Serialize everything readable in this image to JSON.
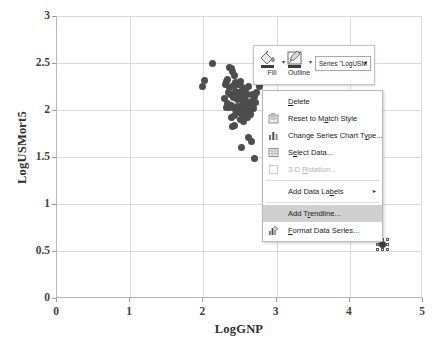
{
  "chart_data": {
    "type": "scatter",
    "title": "",
    "xlabel": "LogGNP",
    "ylabel": "LogUSMort5",
    "xlim": [
      0,
      5
    ],
    "ylim": [
      0,
      3
    ],
    "xticks": [
      "0",
      "1",
      "2",
      "3",
      "4",
      "5"
    ],
    "yticks": [
      "0",
      "0.5",
      "1",
      "1.5",
      "2",
      "2.5",
      "3"
    ],
    "grid": true,
    "legend": "none",
    "series": [
      {
        "name": "LogUSMort5",
        "marker": "circle",
        "color": "#4d4d4d",
        "points": [
          [
            2.13,
            2.49
          ],
          [
            2.01,
            2.31
          ],
          [
            1.99,
            2.25
          ],
          [
            2.31,
            2.3
          ],
          [
            2.33,
            2.32
          ],
          [
            2.3,
            2.27
          ],
          [
            2.35,
            2.45
          ],
          [
            2.38,
            2.44
          ],
          [
            2.4,
            2.41
          ],
          [
            2.42,
            2.37
          ],
          [
            2.36,
            2.24
          ],
          [
            2.44,
            2.29
          ],
          [
            2.46,
            2.27
          ],
          [
            2.5,
            2.3
          ],
          [
            2.53,
            2.24
          ],
          [
            2.48,
            2.19
          ],
          [
            2.45,
            2.17
          ],
          [
            2.41,
            2.13
          ],
          [
            2.52,
            2.12
          ],
          [
            2.55,
            2.18
          ],
          [
            2.58,
            2.22
          ],
          [
            2.62,
            2.25
          ],
          [
            2.6,
            2.16
          ],
          [
            2.57,
            2.1
          ],
          [
            2.54,
            2.06
          ],
          [
            2.5,
            2.03
          ],
          [
            2.47,
            2.04
          ],
          [
            2.43,
            2.02
          ],
          [
            2.39,
            2.05
          ],
          [
            2.36,
            2.03
          ],
          [
            2.33,
            2.07
          ],
          [
            2.31,
            2.03
          ],
          [
            2.59,
            2.04
          ],
          [
            2.63,
            2.06
          ],
          [
            2.66,
            2.09
          ],
          [
            2.7,
            2.14
          ],
          [
            2.73,
            2.19
          ],
          [
            2.76,
            2.25
          ],
          [
            2.68,
            2.02
          ],
          [
            2.64,
            2.0
          ],
          [
            2.61,
            1.98
          ],
          [
            2.57,
            1.96
          ],
          [
            2.53,
            1.95
          ],
          [
            2.49,
            1.97
          ],
          [
            2.45,
            1.99
          ],
          [
            2.42,
            1.94
          ],
          [
            2.38,
            1.92
          ],
          [
            2.51,
            1.9
          ],
          [
            2.55,
            1.88
          ],
          [
            2.6,
            1.92
          ],
          [
            2.47,
            2.11
          ],
          [
            2.44,
            2.2
          ],
          [
            2.37,
            2.16
          ],
          [
            2.34,
            2.19
          ],
          [
            2.29,
            2.12
          ],
          [
            2.67,
            2.17
          ],
          [
            2.71,
            2.08
          ],
          [
            2.43,
            1.84
          ],
          [
            2.4,
            1.82
          ],
          [
            2.62,
            1.71
          ],
          [
            2.66,
            1.67
          ],
          [
            2.52,
            1.6
          ],
          [
            2.7,
            1.48
          ],
          [
            2.49,
            2.27
          ],
          [
            2.56,
            2.01
          ],
          [
            2.65,
            1.95
          ],
          [
            2.41,
            2.26
          ],
          [
            3.92,
            0.68
          ]
        ]
      },
      {
        "name": "selected-point",
        "marker": "circle-selected",
        "color": "#3d3d3d",
        "points": [
          [
            4.45,
            0.57
          ]
        ]
      }
    ]
  },
  "mini_toolbar": {
    "fill_label": "Fill",
    "fill_icon": "paint-bucket-icon",
    "outline_label": "Outline",
    "outline_icon": "pencil-outline-icon",
    "series_selector_value": "Series \"LogUSM",
    "caret": "▾"
  },
  "context_menu": {
    "items": [
      {
        "label": "Delete",
        "icon": "",
        "state": "normal",
        "accel": "D",
        "submenu": false
      },
      {
        "label": "Reset to Match Style",
        "icon": "reset-style-icon",
        "state": "normal",
        "accel": "a",
        "submenu": false
      },
      {
        "label": "Change Series Chart Type...",
        "icon": "chart-type-icon",
        "state": "normal",
        "accel": "y",
        "submenu": false
      },
      {
        "label": "Select Data...",
        "icon": "select-data-icon",
        "state": "normal",
        "accel": "e",
        "submenu": false
      },
      {
        "label": "3-D Rotation...",
        "icon": "rotation-3d-icon",
        "state": "disabled",
        "accel": "R",
        "submenu": false
      },
      {
        "label": "Add Data Labels",
        "icon": "",
        "state": "normal",
        "accel": "b",
        "submenu": true
      },
      {
        "label": "Add Trendline...",
        "icon": "",
        "state": "highlighted",
        "accel": "r",
        "submenu": false
      },
      {
        "label": "Format Data Series...",
        "icon": "format-series-icon",
        "state": "normal",
        "accel": "F",
        "submenu": false
      }
    ],
    "separator_after": [
      4,
      5
    ],
    "submenu_arrow": "▸"
  },
  "colors": {
    "marker": "#4d4d4d",
    "gridline": "#d9d9d9",
    "axis": "#b6b6b6",
    "menu_highlight": "#cfcfcf",
    "text": "#2e2e2e"
  }
}
